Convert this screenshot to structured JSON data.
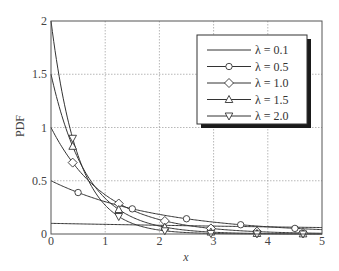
{
  "chart_data": {
    "type": "line",
    "title": "",
    "xlabel": "x",
    "ylabel": "PDF",
    "xlim": [
      0,
      5
    ],
    "ylim": [
      0,
      2
    ],
    "xticks": [
      "0",
      "1",
      "2",
      "3",
      "4",
      "5"
    ],
    "yticks": [
      "0",
      "0.5",
      "1",
      "1.5",
      "2"
    ],
    "grid": true,
    "legend_position": "upper right",
    "function": "lambda * exp(-lambda * x)",
    "series": [
      {
        "name": "λ = 0.1",
        "lambda": 0.1,
        "marker": "none",
        "marker_x": []
      },
      {
        "name": "λ = 0.5",
        "lambda": 0.5,
        "marker": "circle",
        "marker_x": [
          0.5,
          1.5,
          2.5,
          3.5,
          4.5
        ]
      },
      {
        "name": "λ = 1.0",
        "lambda": 1.0,
        "marker": "diamond",
        "marker_x": [
          0.4,
          1.25,
          2.1,
          2.95,
          3.8,
          4.65
        ]
      },
      {
        "name": "λ = 1.5",
        "lambda": 1.5,
        "marker": "triangle-up",
        "marker_x": [
          0.4,
          1.25,
          2.1,
          2.95,
          3.8,
          4.65
        ]
      },
      {
        "name": "λ = 2.0",
        "lambda": 2.0,
        "marker": "triangle-down",
        "marker_x": [
          0.4,
          1.25,
          2.1,
          2.95,
          3.8,
          4.65
        ]
      }
    ]
  },
  "axes": {
    "xlabel": "x",
    "ylabel": "PDF",
    "xticks": [
      "0",
      "1",
      "2",
      "3",
      "4",
      "5"
    ],
    "yticks": [
      "0",
      "0.5",
      "1",
      "1.5",
      "2"
    ]
  },
  "legend": {
    "items": [
      {
        "label": "λ = 0.1"
      },
      {
        "label": "λ = 0.5"
      },
      {
        "label": "λ = 1.0"
      },
      {
        "label": "λ = 1.5"
      },
      {
        "label": "λ = 2.0"
      }
    ]
  },
  "colors": {
    "line": "#333333",
    "grid": "#999999",
    "frame": "#555555",
    "shadow": "#1a1a1a"
  }
}
